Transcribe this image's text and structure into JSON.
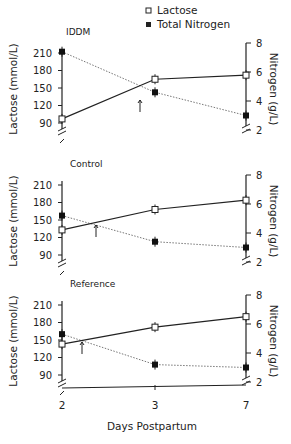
{
  "legend": {
    "lactose": "Lactose",
    "nitrogen": "Total Nitrogen"
  },
  "xaxis": {
    "label": "Days Postpartum",
    "ticks": [
      "2",
      "3",
      "7"
    ]
  },
  "left_axis": {
    "label": "Lactose (mmol/L)",
    "ticks": [
      "210",
      "180",
      "150",
      "120",
      "90"
    ]
  },
  "right_axis": {
    "label": "Nitrogen (g/L)",
    "ticks": [
      "8",
      "6",
      "4",
      "2"
    ]
  },
  "panels": [
    {
      "title": "IDDM"
    },
    {
      "title": "Control"
    },
    {
      "title": "Reference"
    }
  ],
  "chart_data": {
    "type": "line",
    "title": "",
    "x": [
      "2",
      "3",
      "7"
    ],
    "xlabel": "Days Postpartum",
    "ylabel": "Lactose (mmol/L)",
    "y2label": "Nitrogen (g/L)",
    "ylim": [
      90,
      210
    ],
    "y2lim": [
      2,
      8
    ],
    "legend": [
      "Lactose",
      "Total Nitrogen"
    ],
    "annotations": [
      "Arrows mark crossover between lactose and nitrogen curves"
    ],
    "panels": [
      {
        "title": "IDDM",
        "series": [
          {
            "name": "Lactose",
            "axis": "left",
            "values": [
              97,
              165,
              172
            ]
          },
          {
            "name": "Total Nitrogen",
            "axis": "right",
            "values": [
              7.4,
              4.6,
              3.0
            ]
          }
        ]
      },
      {
        "title": "Control",
        "series": [
          {
            "name": "Lactose",
            "axis": "left",
            "values": [
              133,
              168,
              184
            ]
          },
          {
            "name": "Total Nitrogen",
            "axis": "right",
            "values": [
              5.2,
              3.4,
              3.0
            ]
          }
        ]
      },
      {
        "title": "Reference",
        "series": [
          {
            "name": "Lactose",
            "axis": "left",
            "values": [
              143,
              172,
              190
            ]
          },
          {
            "name": "Total Nitrogen",
            "axis": "right",
            "values": [
              5.3,
              3.2,
              3.0
            ]
          }
        ]
      }
    ]
  }
}
